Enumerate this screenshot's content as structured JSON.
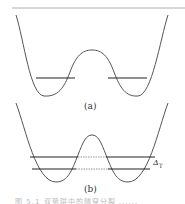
{
  "figure": {
    "panel_a": {
      "label": "(a)",
      "description": "Symmetric double-well potential with one energy level in each well (localized states)"
    },
    "panel_b": {
      "label": "(b)",
      "description": "Double-well potential with tunneling-split energy levels extending through the barrier",
      "splitting_label": "Δ",
      "splitting_subscript": "T"
    },
    "caption": "图 5.1  双势阱中的隧穿分裂 ......",
    "colors": {
      "curve": "#555555",
      "level_line": "#222222",
      "dotted_line": "#888888",
      "top_rule": "#999999"
    }
  }
}
